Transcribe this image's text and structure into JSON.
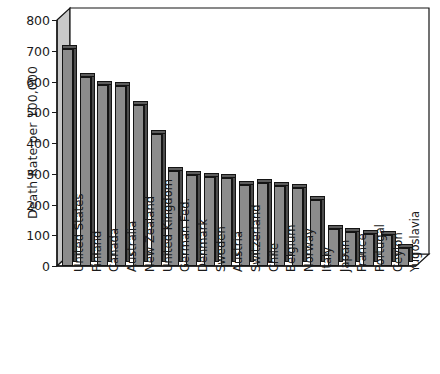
{
  "chart_data": {
    "type": "bar",
    "title": "",
    "xlabel": "",
    "ylabel": "Death Rate per 100,000",
    "ylim": [
      0,
      800
    ],
    "yticks": [
      0,
      100,
      200,
      300,
      400,
      500,
      600,
      700,
      800
    ],
    "grid": false,
    "legend": null,
    "orientation": "vertical",
    "style": "3d-shaded-bars",
    "bar_color": "#8c8c8c",
    "categories": [
      "United States",
      "Finland",
      "Canada",
      "Australia",
      "New Zealand",
      "United Kingdom",
      "German Fed.",
      "Denmark",
      "Sweden",
      "Austria",
      "Switzerland",
      "Chile",
      "Belgium",
      "Norway",
      "Italy",
      "Japan",
      "France",
      "Portugal",
      "Ceylon",
      "Yugoslavia"
    ],
    "values": [
      705,
      615,
      590,
      585,
      525,
      430,
      310,
      295,
      290,
      285,
      265,
      270,
      260,
      255,
      215,
      120,
      110,
      105,
      100,
      60
    ]
  }
}
